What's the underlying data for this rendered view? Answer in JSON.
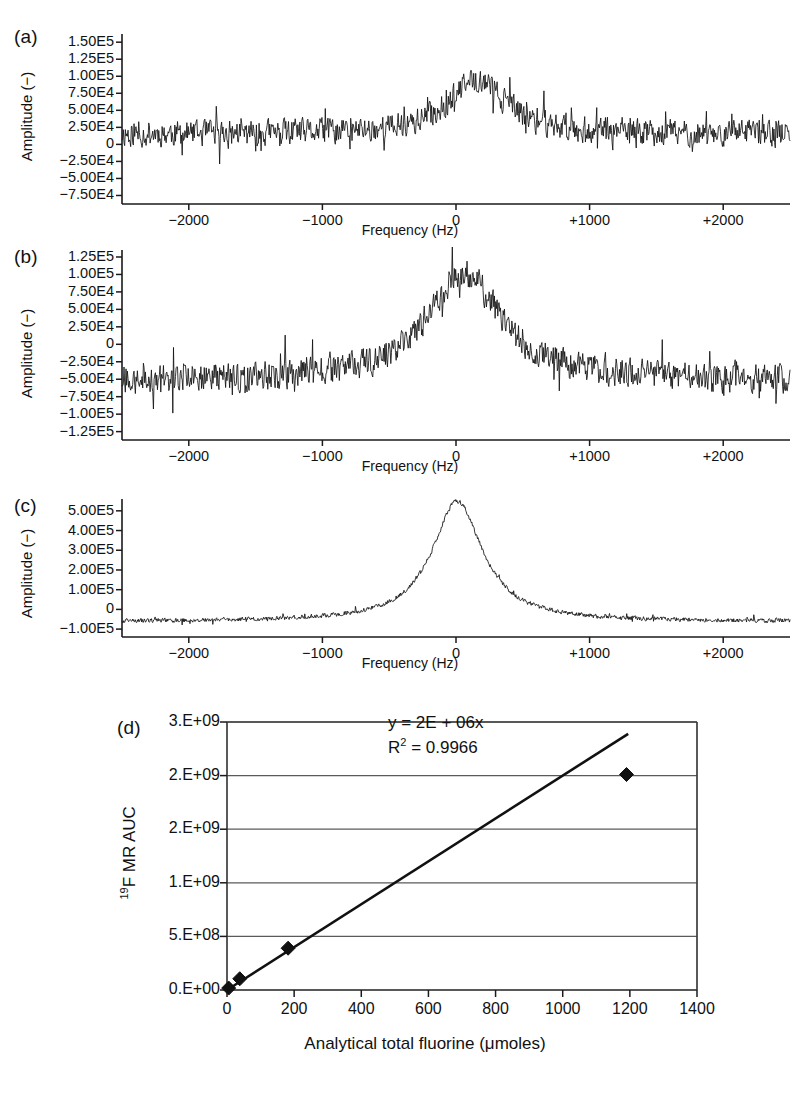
{
  "figure": {
    "panels": [
      {
        "label": "(a)",
        "ylabel": "Amplitude (−)",
        "xlabel": "Frequency (Hz)",
        "yticks": [
          "1.50E5",
          "1.25E5",
          "1.00E5",
          "7.50E4",
          "5.00E4",
          "2.50E4",
          "0",
          "−2.50E4",
          "−5.00E4",
          "−7.50E4"
        ],
        "ytick_values": [
          150000,
          125000,
          100000,
          75000,
          50000,
          25000,
          0,
          -25000,
          -50000,
          -75000
        ],
        "xticks": [
          "−2000",
          "−1000",
          "0",
          "+1000",
          "+2000"
        ],
        "xtick_values": [
          -2000,
          -1000,
          0,
          1000,
          2000
        ]
      },
      {
        "label": "(b)",
        "ylabel": "Amplitude (−)",
        "xlabel": "Frequency (Hz)",
        "yticks": [
          "1.25E5",
          "1.00E5",
          "7.50E4",
          "5.00E4",
          "2.50E4",
          "0",
          "−2.50E4",
          "−5.00E4",
          "−7.50E4",
          "−1.00E5",
          "−1.25E5"
        ],
        "ytick_values": [
          125000,
          100000,
          75000,
          50000,
          25000,
          0,
          -25000,
          -50000,
          -75000,
          -100000,
          -125000
        ],
        "xticks": [
          "−2000",
          "−1000",
          "0",
          "+1000",
          "+2000"
        ],
        "xtick_values": [
          -2000,
          -1000,
          0,
          1000,
          2000
        ]
      },
      {
        "label": "(c)",
        "ylabel": "Amplitude (−)",
        "xlabel": "Frequency (Hz)",
        "yticks": [
          "5.00E5",
          "4.00E5",
          "3.00E5",
          "2.00E5",
          "1.00E5",
          "0",
          "−1.00E5"
        ],
        "ytick_values": [
          500000,
          400000,
          300000,
          200000,
          100000,
          0,
          -100000
        ],
        "xticks": [
          "−2000",
          "−1000",
          "0",
          "+1000",
          "+2000"
        ],
        "xtick_values": [
          -2000,
          -1000,
          0,
          1000,
          2000
        ]
      },
      {
        "label": "(d)",
        "ylabel_prefix": "19",
        "ylabel_main": "F MR AUC",
        "xlabel": "Analytical total fluorine (μmoles)",
        "yticks": [
          "0.E+00",
          "5.E+08",
          "1.E+09",
          "2.E+09",
          "2.E+09",
          "3.E+09"
        ],
        "ytick_values": [
          0,
          500000000,
          1000000000,
          1500000000,
          2000000000,
          2500000000
        ],
        "xticks": [
          "0",
          "200",
          "400",
          "600",
          "800",
          "1000",
          "1200",
          "1400"
        ],
        "xtick_values": [
          0,
          200,
          400,
          600,
          800,
          1000,
          1200,
          1400
        ],
        "equation": "y = 2E + 06x",
        "r_squared_prefix": "R",
        "r_squared_sup": "2",
        "r_squared_value": " = 0.9966"
      }
    ]
  },
  "chart_data": [
    {
      "type": "line",
      "panel": "a",
      "title": "",
      "xlabel": "Frequency (Hz)",
      "ylabel": "Amplitude (−)",
      "xlim": [
        -2500,
        2500
      ],
      "ylim": [
        -87500,
        162000
      ],
      "grid": false,
      "description": "19F MR spectrum, low SNR, weak broad resonance centered near +150 Hz",
      "noise_amplitude": 24000,
      "baseline": 15000,
      "peaks": [
        {
          "center": 160,
          "height": 80000,
          "width": 260
        }
      ],
      "n_points": 1000,
      "seed": 11
    },
    {
      "type": "line",
      "panel": "b",
      "title": "",
      "xlabel": "Frequency (Hz)",
      "ylabel": "Amplitude (−)",
      "xlim": [
        -2500,
        2500
      ],
      "ylim": [
        -137000,
        135000
      ],
      "grid": false,
      "description": "19F MR spectrum, medium SNR, broad resonance centered near +60 Hz on a negative baseline",
      "noise_amplitude": 26000,
      "baseline": -52000,
      "peaks": [
        {
          "center": 60,
          "height": 155000,
          "width": 330
        }
      ],
      "n_points": 1000,
      "seed": 27
    },
    {
      "type": "line",
      "panel": "c",
      "title": "",
      "xlabel": "Frequency (Hz)",
      "ylabel": "Amplitude (−)",
      "xlim": [
        -2500,
        2500
      ],
      "ylim": [
        -140000,
        560000
      ],
      "grid": false,
      "description": "19F MR spectrum, high SNR, sharp Lorentzian resonance at 0 Hz",
      "noise_amplitude": 14000,
      "baseline": -62000,
      "peaks": [
        {
          "center": 10,
          "height": 610000,
          "width": 230
        }
      ],
      "n_points": 1200,
      "seed": 43
    },
    {
      "type": "scatter",
      "panel": "d",
      "title": "",
      "xlabel": "Analytical total fluorine (μmoles)",
      "ylabel": "19F MR AUC",
      "xlim": [
        0,
        1400
      ],
      "ylim": [
        0,
        2500000000
      ],
      "grid": true,
      "x": [
        5,
        38,
        182,
        1190
      ],
      "y": [
        18000000,
        105000000,
        390000000,
        2010000000
      ],
      "fit": {
        "slope": 2000000,
        "intercept": 0,
        "equation": "y = 2E + 06x",
        "r_squared": 0.9966
      },
      "marker": "diamond",
      "legend": "none"
    }
  ]
}
